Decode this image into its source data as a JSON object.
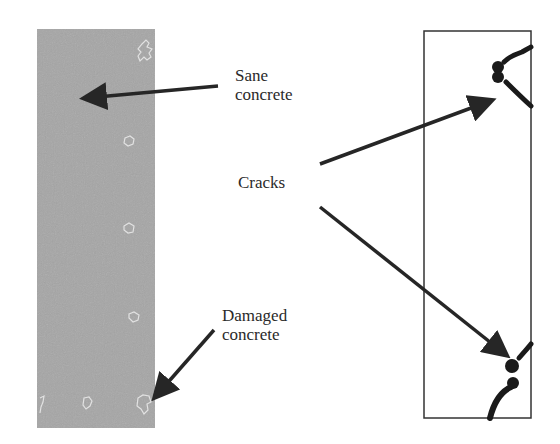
{
  "figure": {
    "left_panel": {
      "description": "Damage map of concrete column (gray)",
      "fill_color": "#a6a6a6",
      "damage_mark_color": "#e2e2e2"
    },
    "right_panel": {
      "description": "Crack pattern of column (outlined)",
      "border_color": "#333333",
      "crack_color": "#1a1a1a"
    },
    "labels": {
      "sane": {
        "line1": "Sane",
        "line2": "concrete"
      },
      "cracks": {
        "line1": "Cracks"
      },
      "damaged": {
        "line1": "Damaged",
        "line2": "concrete"
      }
    },
    "arrow_color": "#262626"
  }
}
